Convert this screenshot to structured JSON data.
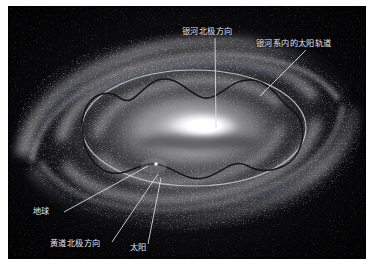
{
  "figure": {
    "kind": "astronomy-illustration",
    "palette": {
      "page_background": "#ffffff",
      "plate_background": "#050507",
      "core_highlight": "#ffffff",
      "disk_gray": "#b9b9bd",
      "dust_lane": "#2a2a2e",
      "label_text": "#e9e9ec",
      "leader_line": "#d9d9dd",
      "orbit_ring": "#c9c9cf",
      "orbit_wave": "#1b1b20"
    },
    "annotations": [
      {
        "id": "galactic-pole",
        "text": "银河北极方向",
        "leader": "vertical line descending from label to the bright galactic core"
      },
      {
        "id": "solar-orbit",
        "text": "银河系内的太阳轨道",
        "leader": "diagonal line running down-left to the wavy orbital track"
      },
      {
        "id": "earth",
        "text": "地球",
        "leader": "diagonal line running up-right to the Sun's neighbourhood on the disk"
      },
      {
        "id": "ecliptic-pole",
        "text": "黄道北极方向",
        "leader": "diagonal line running up-right to the Sun's neighbourhood on the disk"
      },
      {
        "id": "sun",
        "text": "太阳",
        "leader": "near-vertical line running up to the Sun's marker on the disk"
      }
    ]
  },
  "labels": {
    "galactic_pole": "银河北极方向",
    "solar_orbit": "银河系内的太阳轨道",
    "earth": "地球",
    "ecliptic_pole": "黄道北极方向",
    "sun": "太阳"
  }
}
